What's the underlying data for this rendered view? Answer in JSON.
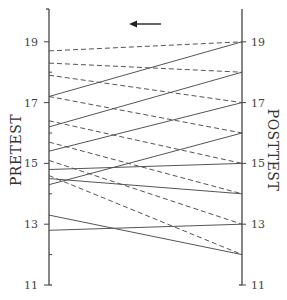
{
  "chart_data": {
    "type": "line",
    "subtype": "slopegraph",
    "title": "",
    "left_axis_label": "PRETEST",
    "right_axis_label": "POSTTEST",
    "ylim": [
      11,
      20
    ],
    "tick_values": [
      11,
      13,
      15,
      17,
      19
    ],
    "tick_labels": [
      "11",
      "13",
      "15",
      "17",
      "19"
    ],
    "minor_ticks": [
      12,
      14,
      16,
      18
    ],
    "grid": false,
    "annotation": "arrow pointing left",
    "styles": {
      "solid": "#555555",
      "dashed": "#555555"
    },
    "series": [
      {
        "name": "pair-1",
        "pretest": 18.7,
        "posttest": 19.0,
        "style": "dashed"
      },
      {
        "name": "pair-2",
        "pretest": 18.3,
        "posttest": 18.0,
        "style": "dashed"
      },
      {
        "name": "pair-3",
        "pretest": 17.9,
        "posttest": 17.0,
        "style": "dashed"
      },
      {
        "name": "pair-4",
        "pretest": 17.2,
        "posttest": 16.0,
        "style": "dashed"
      },
      {
        "name": "pair-5",
        "pretest": 16.4,
        "posttest": 15.0,
        "style": "dashed"
      },
      {
        "name": "pair-6",
        "pretest": 15.7,
        "posttest": 14.0,
        "style": "dashed"
      },
      {
        "name": "pair-7",
        "pretest": 15.1,
        "posttest": 13.0,
        "style": "dashed"
      },
      {
        "name": "pair-8",
        "pretest": 14.6,
        "posttest": 12.0,
        "style": "dashed"
      },
      {
        "name": "pair-9",
        "pretest": 17.2,
        "posttest": 19.0,
        "style": "solid"
      },
      {
        "name": "pair-10",
        "pretest": 16.2,
        "posttest": 18.0,
        "style": "solid"
      },
      {
        "name": "pair-11",
        "pretest": 15.4,
        "posttest": 17.0,
        "style": "solid"
      },
      {
        "name": "pair-12",
        "pretest": 14.3,
        "posttest": 16.0,
        "style": "solid"
      },
      {
        "name": "pair-13",
        "pretest": 14.8,
        "posttest": 15.0,
        "style": "solid"
      },
      {
        "name": "pair-14",
        "pretest": 14.5,
        "posttest": 14.0,
        "style": "solid"
      },
      {
        "name": "pair-15",
        "pretest": 12.8,
        "posttest": 13.0,
        "style": "solid"
      },
      {
        "name": "pair-16",
        "pretest": 13.3,
        "posttest": 12.0,
        "style": "solid"
      }
    ]
  },
  "layout": {
    "left_x": 49,
    "right_x": 242,
    "y_at_11": 285,
    "px_per_unit": 30.4,
    "axis_top": 9
  }
}
